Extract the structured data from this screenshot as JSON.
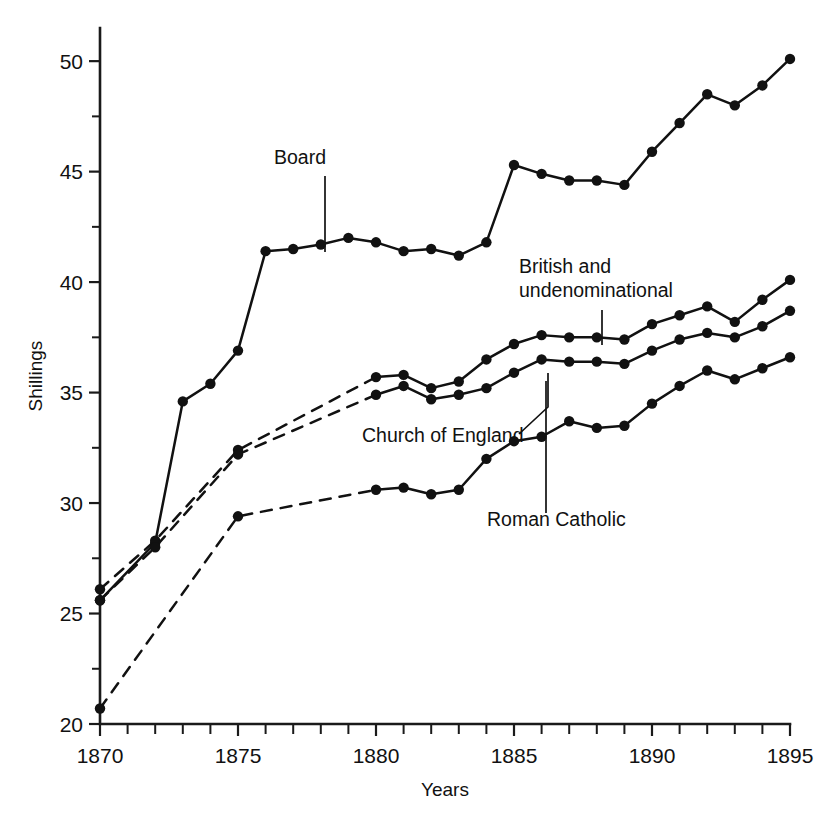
{
  "chart_data": {
    "type": "line",
    "title": "",
    "xlabel": "Years",
    "ylabel": "Shillings",
    "xlim": [
      1870,
      1895
    ],
    "ylim": [
      20,
      51.5
    ],
    "grid": false,
    "legend_position": "inline-annotations",
    "x_major_ticks": [
      1870,
      1875,
      1880,
      1885,
      1890,
      1895
    ],
    "x_tick_labels": [
      "1870",
      "1875",
      "1880",
      "1885",
      "1890",
      "1895"
    ],
    "x_minor_tick_step": 1,
    "y_major_ticks": [
      20,
      25,
      30,
      35,
      40,
      45,
      50
    ],
    "y_tick_labels": [
      "20",
      "25",
      "30",
      "35",
      "40",
      "45",
      "50"
    ],
    "y_minor_ticks": [
      22.5,
      27.5,
      32.5,
      37.5,
      42.5,
      47.5
    ],
    "series": [
      {
        "name": "Board",
        "style": "solid",
        "x": [
          1870,
          1872,
          1873,
          1874,
          1875,
          1876,
          1877,
          1878,
          1879,
          1880,
          1881,
          1882,
          1883,
          1884,
          1885,
          1886,
          1887,
          1888,
          1889,
          1890,
          1891,
          1892,
          1893,
          1894,
          1895
        ],
        "values": [
          25.6,
          28.2,
          34.6,
          35.4,
          36.9,
          41.4,
          41.5,
          41.7,
          42.0,
          41.8,
          41.4,
          41.5,
          41.2,
          41.8,
          45.3,
          44.9,
          44.6,
          44.6,
          44.4,
          45.9,
          47.2,
          48.5,
          48.0,
          48.9,
          50.1
        ]
      },
      {
        "name": "British and undenominational",
        "style": "dashed-then-solid",
        "solid_from": 1880,
        "x": [
          1870,
          1872,
          1875,
          1880,
          1881,
          1882,
          1883,
          1884,
          1885,
          1886,
          1887,
          1888,
          1889,
          1890,
          1891,
          1892,
          1893,
          1894,
          1895
        ],
        "values": [
          26.1,
          28.3,
          32.4,
          35.7,
          35.8,
          35.2,
          35.5,
          36.5,
          37.2,
          37.6,
          37.5,
          37.5,
          37.4,
          38.1,
          38.5,
          38.9,
          38.2,
          39.2,
          40.1
        ]
      },
      {
        "name": "Church of England",
        "style": "dashed-then-solid",
        "solid_from": 1880,
        "x": [
          1870,
          1872,
          1875,
          1880,
          1881,
          1882,
          1883,
          1884,
          1885,
          1886,
          1887,
          1888,
          1889,
          1890,
          1891,
          1892,
          1893,
          1894,
          1895
        ],
        "values": [
          25.6,
          28.0,
          32.2,
          34.9,
          35.3,
          34.7,
          34.9,
          35.2,
          35.9,
          36.5,
          36.4,
          36.4,
          36.3,
          36.9,
          37.4,
          37.7,
          37.5,
          38.0,
          38.7
        ]
      },
      {
        "name": "Roman Catholic",
        "style": "dashed-then-solid",
        "solid_from": 1880,
        "x": [
          1870,
          1875,
          1880,
          1881,
          1882,
          1883,
          1884,
          1885,
          1886,
          1887,
          1888,
          1889,
          1890,
          1891,
          1892,
          1893,
          1894,
          1895
        ],
        "values": [
          20.7,
          29.4,
          30.6,
          30.7,
          30.4,
          30.6,
          32.0,
          32.8,
          33.0,
          33.7,
          33.4,
          33.5,
          34.5,
          35.3,
          36.0,
          35.6,
          36.1,
          36.6
        ]
      }
    ],
    "annotations": [
      {
        "label": "Board",
        "lines": [
          "Board"
        ],
        "text_x": 300,
        "text_y": 164,
        "anchor": "middle",
        "leader": "M 325,176 L 325,252"
      },
      {
        "label": "British and undenominational",
        "lines": [
          "British and",
          "undenominational"
        ],
        "text_x": 519,
        "text_y": 273,
        "anchor": "start",
        "leader": "M 602,310 L 602,345"
      },
      {
        "label": "Church of England",
        "lines": [
          "Church of England"
        ],
        "text_x": 362,
        "text_y": 442,
        "anchor": "start",
        "leader": "M 519,434 L 548,407 L 548,373"
      },
      {
        "label": "Roman Catholic",
        "lines": [
          "Roman Catholic"
        ],
        "text_x": 487,
        "text_y": 526,
        "anchor": "start",
        "leader": "M 546,513 L 546,381"
      }
    ],
    "marker_radius": 5.2,
    "dash_pattern": "11 9",
    "colors": {
      "line": "#111111",
      "marker": "#111111",
      "axis": "#1a1a1a",
      "background": "#ffffff"
    }
  },
  "plot_geometry": {
    "left": 100,
    "right": 790,
    "top": 28,
    "bottom": 724
  }
}
